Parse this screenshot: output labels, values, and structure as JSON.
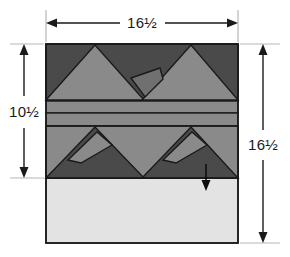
{
  "diagram": {
    "dimensions": {
      "top": {
        "label": "16½",
        "name": "block-width"
      },
      "left": {
        "label": "10½",
        "name": "pieced-section-height"
      },
      "right": {
        "label": "16½",
        "name": "block-height"
      }
    },
    "arrow_annotation": {
      "name": "press-direction-arrow",
      "direction": "down"
    },
    "colors": {
      "dark_gray": "#4a4a4a",
      "medium_gray": "#8a8a8a",
      "light_gray": "#e3e3e3",
      "outline": "#1a1a1a",
      "background": "#ffffff",
      "dim_line": "#1a1a1a",
      "guide_line": "#b8b8b8"
    },
    "bands": [
      {
        "name": "top-triangle-band",
        "background": "dark_gray",
        "triangles": "two light-gray peaks pointing up",
        "detail_shapes": 1
      },
      {
        "name": "upper-strip",
        "background": "medium_gray"
      },
      {
        "name": "lower-strip",
        "background": "medium_gray"
      },
      {
        "name": "bottom-triangle-band",
        "background": "medium_gray",
        "triangles": "two dark-gray peaks pointing up",
        "detail_shapes": 2
      },
      {
        "name": "plain-bottom-panel",
        "background": "light_gray"
      }
    ]
  }
}
